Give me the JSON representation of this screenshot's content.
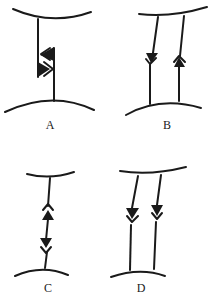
{
  "figure": {
    "panels": [
      {
        "id": "A",
        "label": "A",
        "description": "Single vertical line between two curved surfaces with an opposing pair of arrow markers (one filled left-pointing, one open chevron) stacked on the right side",
        "lines": 1,
        "arrows": [
          "filled-left",
          "open-chevron-left",
          "filled-right",
          "open-chevron-right"
        ]
      },
      {
        "id": "B",
        "label": "B",
        "description": "Two parallel lines between curved surfaces; left line has a downward filled arrow with open chevron, right line has an upward filled arrow with open chevron",
        "lines": 2,
        "arrows": [
          "filled-down",
          "open-chevron-down",
          "filled-up",
          "open-chevron-up"
        ]
      },
      {
        "id": "C",
        "label": "C",
        "description": "Single vertical line between curved surfaces with an upward arrow pair above and a downward arrow pair below",
        "lines": 1,
        "arrows": [
          "open-chevron-up",
          "filled-up",
          "filled-down",
          "open-chevron-down"
        ]
      },
      {
        "id": "D",
        "label": "D",
        "description": "Two parallel lines between curved surfaces, both with downward filled arrows and open chevrons",
        "lines": 2,
        "arrows": [
          "filled-down",
          "open-chevron-down",
          "filled-down",
          "open-chevron-down"
        ]
      }
    ],
    "colors": {
      "stroke": "#1a1a1a",
      "background": "#ffffff"
    }
  }
}
